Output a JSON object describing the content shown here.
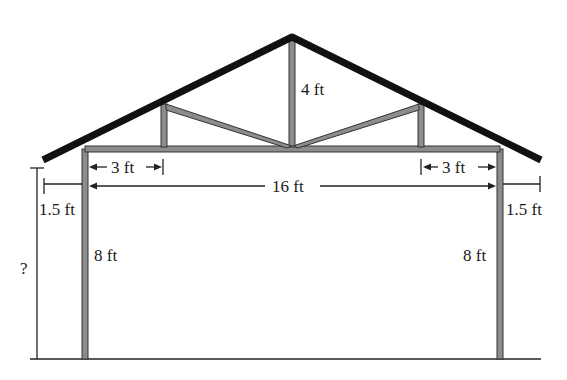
{
  "diagram": {
    "type": "roof-truss-cross-section",
    "colors": {
      "roof": "#111111",
      "member_fill": "#8c8c8c",
      "member_edge": "#333333",
      "dimension_line": "#222222",
      "background": "#ffffff"
    },
    "labels": {
      "king_post_height": "4 ft",
      "left_inner_span": "3 ft",
      "right_inner_span": "3 ft",
      "total_span": "16 ft",
      "left_overhang": "1.5 ft",
      "right_overhang": "1.5 ft",
      "left_wall_height": "8 ft",
      "right_wall_height": "8 ft",
      "unknown_height": "?"
    }
  }
}
